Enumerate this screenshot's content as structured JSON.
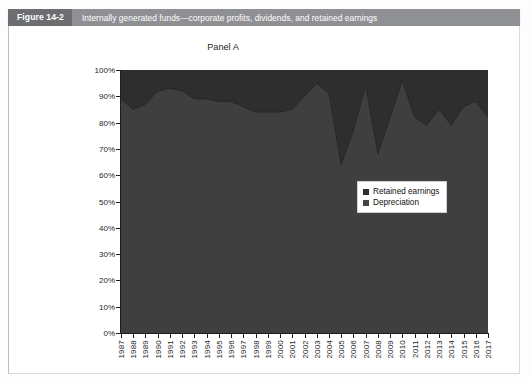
{
  "figure": {
    "number": "Figure 14-2",
    "caption": "Internally generated funds—corporate profits, dividends, and retained earnings"
  },
  "chart_data": {
    "type": "area",
    "stacked": true,
    "title": "Panel A",
    "xlabel": "",
    "ylabel": "",
    "ylim": [
      0,
      100
    ],
    "ytick_labels": [
      "100%",
      "90%",
      "80%",
      "70%",
      "60%",
      "50%",
      "40%",
      "30%",
      "20%",
      "10%",
      "0%"
    ],
    "ytick_values": [
      100,
      90,
      80,
      70,
      60,
      50,
      40,
      30,
      20,
      10,
      0
    ],
    "grid": false,
    "legend_position": "center-right",
    "categories": [
      "1987",
      "1988",
      "1989",
      "1990",
      "1991",
      "1992",
      "1993",
      "1994",
      "1995",
      "1996",
      "1997",
      "1998",
      "1999",
      "2000",
      "2001",
      "2002",
      "2003",
      "2004",
      "2005",
      "2006",
      "2007",
      "2008",
      "2009",
      "2010",
      "2011",
      "2012",
      "2013",
      "2014",
      "2015",
      "2016",
      "2017"
    ],
    "series": [
      {
        "name": "Depreciation",
        "color": "#3f3f3f",
        "values": [
          89,
          85,
          87,
          92,
          93,
          92,
          89,
          89,
          88,
          88,
          86,
          84,
          84,
          84,
          85,
          90,
          95,
          91,
          64,
          77,
          94,
          68,
          82,
          96,
          82,
          79,
          85,
          79,
          86,
          88,
          82
        ]
      },
      {
        "name": "Retained earnings",
        "color": "#2e2e2e",
        "values": [
          11,
          15,
          13,
          8,
          7,
          8,
          11,
          11,
          12,
          12,
          14,
          16,
          16,
          16,
          15,
          10,
          5,
          9,
          36,
          23,
          6,
          32,
          18,
          4,
          18,
          21,
          15,
          21,
          14,
          12,
          18
        ]
      }
    ],
    "totals": [
      100,
      100,
      100,
      100,
      100,
      100,
      100,
      100,
      100,
      100,
      100,
      100,
      100,
      100,
      100,
      100,
      100,
      100,
      100,
      100,
      100,
      100,
      100,
      100,
      100,
      100,
      100,
      100,
      100,
      100,
      100
    ],
    "colors": {
      "retained_earnings": "#2e2e2e",
      "depreciation": "#3f3f3f",
      "plot_background": "#3a3a3a",
      "axis": "#1d1d1d"
    }
  },
  "legend": {
    "items": [
      {
        "label": "Retained earnings",
        "swatch": "#2f2f2f"
      },
      {
        "label": "Depreciation",
        "swatch": "#454545"
      }
    ]
  }
}
